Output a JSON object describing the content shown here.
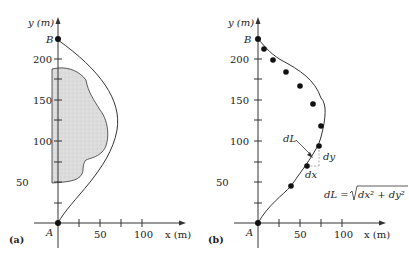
{
  "panel_a": {
    "tag": "(a)",
    "y_axis_label": "y (m)",
    "x_axis_label": "x (m)",
    "y_ticks": [
      "50",
      "100",
      "150",
      "200"
    ],
    "x_ticks": [
      "50",
      "100"
    ],
    "point_start": "A",
    "point_end": "B"
  },
  "panel_b": {
    "tag": "(b)",
    "y_axis_label": "y (m)",
    "x_axis_label": "x (m)",
    "y_ticks": [
      "50",
      "100",
      "150",
      "200"
    ],
    "x_ticks": [
      "50",
      "100"
    ],
    "point_start": "A",
    "point_end": "B",
    "label_dL": "dL",
    "label_dx": "dx",
    "label_dy": "dy",
    "formula_lhs": "dL = ",
    "formula_radicand": "dx² + dy²"
  },
  "colors": {
    "ink": "#222222",
    "shaded_region": "#d9d9d9",
    "dashed": "#999999"
  }
}
